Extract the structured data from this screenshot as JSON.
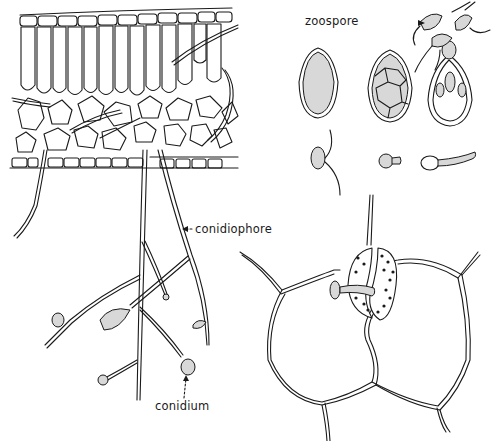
{
  "figure": {
    "panels": [
      {
        "id": "leaf-section",
        "description": "Leaf cross-section with palisade and spongy mesophyll; hyphae emerge through lower epidermis as branched conidiophores"
      },
      {
        "id": "zoospore-release",
        "description": "Conidium/sporangium stages: undivided, cleaved into zoospores, releasing biflagellate zoospores"
      },
      {
        "id": "zoospore-germination",
        "description": "Encysted zoospore germinating with germ tube"
      },
      {
        "id": "stomatal-penetration",
        "description": "Germ tube entering stoma between guard cells on epidermis"
      }
    ]
  },
  "labels": {
    "zoospore": "zoospore",
    "conidiophore": "conidiophore",
    "conidium": "conidium"
  },
  "colors": {
    "ink": "#1a1a1a",
    "stipple": "#d8d8d8",
    "background": "#ffffff"
  }
}
